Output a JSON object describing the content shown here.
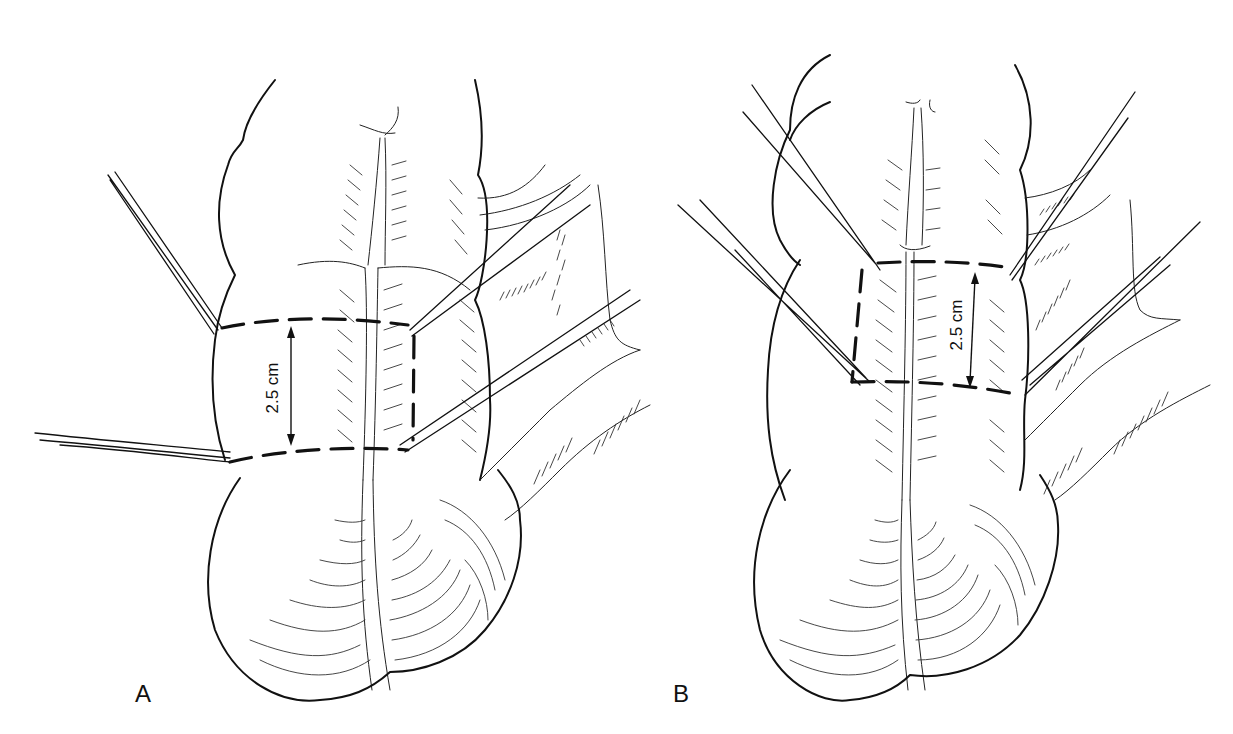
{
  "figure": {
    "panels": [
      {
        "id": "A",
        "label": "A",
        "measurement": "2.5 cm",
        "description": "Dashed rectangular region with stay sutures, horizontal orientation across median raphe"
      },
      {
        "id": "B",
        "label": "B",
        "measurement": "2.5 cm",
        "description": "Dashed rectangular region with stay sutures, shifted placement across median raphe"
      }
    ],
    "colors": {
      "ink": "#111111",
      "background": "#ffffff"
    }
  }
}
